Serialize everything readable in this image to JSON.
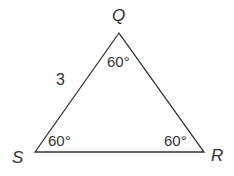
{
  "diagram": {
    "type": "triangle",
    "vertices": {
      "Q": {
        "label": "Q",
        "x": 119,
        "y": 33
      },
      "S": {
        "label": "S",
        "x": 35,
        "y": 152
      },
      "R": {
        "label": "R",
        "x": 204,
        "y": 152
      }
    },
    "side_labels": {
      "QS": "3"
    },
    "angles": {
      "Q": "60°",
      "S": "60°",
      "R": "60°"
    },
    "stroke_color": "#333333"
  }
}
